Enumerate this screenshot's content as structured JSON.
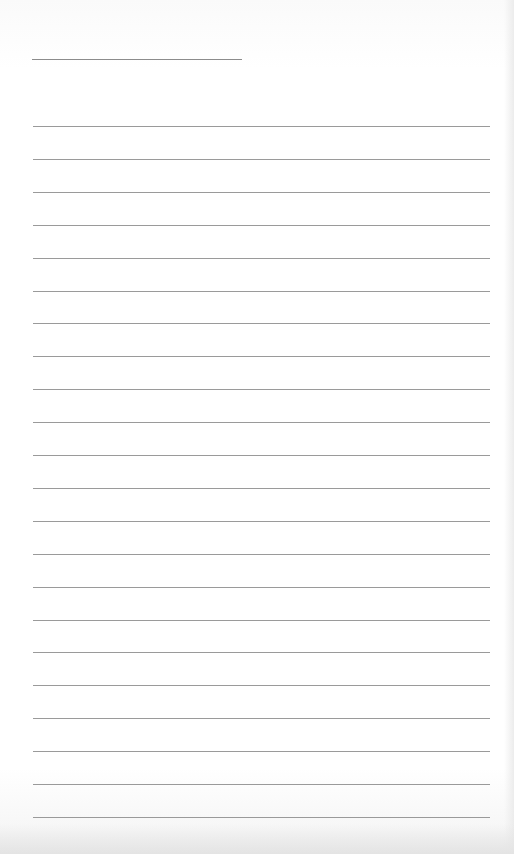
{
  "document": {
    "type": "lined-notebook-page",
    "title_line": {
      "x": 32,
      "y": 59,
      "width": 210
    },
    "rules": {
      "count": 22,
      "first_y": 126,
      "spacing": 32.9,
      "x": 33,
      "width": 457
    },
    "line_color": "#9a9a9a",
    "paper_color": "#ffffff",
    "text": []
  }
}
